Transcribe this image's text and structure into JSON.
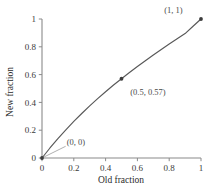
{
  "chart_data": {
    "type": "line",
    "title": "",
    "xlabel": "Old fraction",
    "ylabel": "New fraction",
    "xlim": [
      0,
      1
    ],
    "ylim": [
      0,
      1
    ],
    "grid": false,
    "legend": null,
    "x_ticks": [
      "0",
      "0.2",
      "0.4",
      "0.6",
      "0.8",
      "1"
    ],
    "x_tick_values": [
      0,
      0.2,
      0.4,
      0.6,
      0.8,
      1
    ],
    "y_ticks": [
      "0",
      "0.2",
      "0.4",
      "0.6",
      "0.8",
      "1"
    ],
    "y_tick_values": [
      0,
      0.2,
      0.4,
      0.6,
      0.8,
      1
    ],
    "series": [
      {
        "name": "new vs old fraction",
        "x": [
          0,
          0.05,
          0.1,
          0.15,
          0.2,
          0.25,
          0.3,
          0.35,
          0.4,
          0.45,
          0.5,
          0.55,
          0.6,
          0.65,
          0.7,
          0.75,
          0.8,
          0.85,
          0.9,
          0.95,
          1
        ],
        "y": [
          0,
          0.072,
          0.14,
          0.203,
          0.263,
          0.32,
          0.375,
          0.427,
          0.477,
          0.525,
          0.57,
          0.615,
          0.658,
          0.7,
          0.741,
          0.781,
          0.82,
          0.858,
          0.895,
          0.948,
          1
        ]
      }
    ],
    "markers": [
      {
        "x": 0,
        "y": 0,
        "label": "(0, 0)"
      },
      {
        "x": 0.5,
        "y": 0.57,
        "label": "(0.5, 0.57)"
      },
      {
        "x": 1,
        "y": 1,
        "label": "(1, 1)"
      }
    ],
    "annotations": [
      {
        "text": "(0, 0)",
        "x": 0.155,
        "y": 0.095
      },
      {
        "text": "(0.5, 0.57)",
        "x": 0.555,
        "y": 0.455
      },
      {
        "text": "(1, 1)",
        "x": 0.885,
        "y": 1.045
      }
    ],
    "colors": {
      "curve": "#585858",
      "marker": "#3c3c3c",
      "axis": "#8a8a8a",
      "text": "#3a3a3a",
      "background": "#ffffff"
    }
  }
}
